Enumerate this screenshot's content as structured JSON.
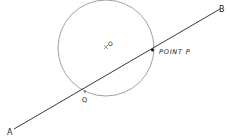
{
  "diagram": {
    "circle": {
      "cx": 106,
      "cy": 48,
      "r": 48,
      "stroke": "#888888"
    },
    "line": {
      "x1": 14,
      "y1": 129,
      "x2": 220,
      "y2": 9,
      "stroke": "#222222"
    },
    "labels": {
      "a": "A",
      "b": "B",
      "o": "O",
      "p": "POINT P",
      "q": "Q"
    }
  }
}
